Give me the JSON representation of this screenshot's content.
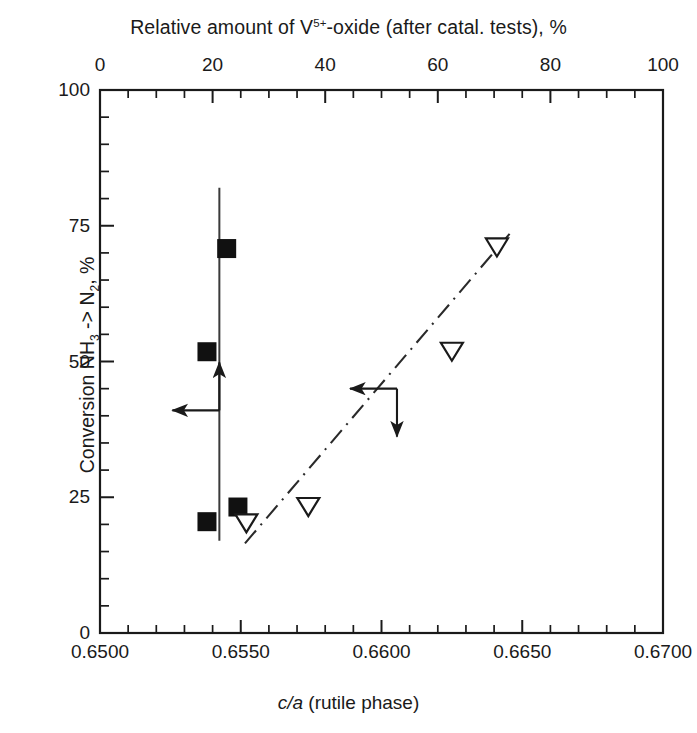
{
  "figure": {
    "top_axis_title": "Relative amount of V5+-oxide (after catal. tests), %",
    "top_axis_title_pre": "Relative amount of V",
    "top_axis_title_sup": "5+",
    "top_axis_title_post": "-oxide (after catal. tests), %",
    "bottom_axis_title_italic": "c/a",
    "bottom_axis_title_rest": " (rutile phase)",
    "y_axis_title_pre": "Conversion NH",
    "y_axis_title_sub1": "3",
    "y_axis_title_mid": " -> N",
    "y_axis_title_sub2": "2",
    "y_axis_title_post": ", %",
    "line_color": "#1a1a1a",
    "marker_color": "#111111"
  },
  "chart_data": {
    "type": "scatter",
    "title": "",
    "xlabel": "c/a (rutile phase)",
    "ylabel": "Conversion NH3 -> N2, %",
    "top_xlabel": "Relative amount of V5+-oxide (after catal. tests), %",
    "xlim": [
      0.65,
      0.67
    ],
    "ylim": [
      0,
      100
    ],
    "top_xlim": [
      0,
      100
    ],
    "grid": false,
    "legend": "none",
    "x_ticks_bottom": [
      "0.6500",
      "0.6550",
      "0.6600",
      "0.6650",
      "0.6700"
    ],
    "x_tick_values_bottom": [
      0.65,
      0.655,
      0.66,
      0.665,
      0.67
    ],
    "x_minor_per_interval_bottom": 4,
    "x_ticks_top": [
      "0",
      "20",
      "40",
      "60",
      "80",
      "100"
    ],
    "x_tick_values_top": [
      0,
      20,
      40,
      60,
      80,
      100
    ],
    "x_minor_per_interval_top": 3,
    "y_ticks": [
      "0",
      "25",
      "50",
      "75",
      "100"
    ],
    "y_tick_values": [
      0,
      25,
      50,
      75,
      100
    ],
    "y_minor_per_interval": 4,
    "series": [
      {
        "name": "filled-squares",
        "marker": "filled-square",
        "axis": "top",
        "points": [
          {
            "x": 22.5,
            "y": 70.8
          },
          {
            "x": 19.0,
            "y": 51.8
          },
          {
            "x": 24.5,
            "y": 23.2
          },
          {
            "x": 19.0,
            "y": 20.5
          }
        ]
      },
      {
        "name": "open-triangles",
        "marker": "open-triangle-down",
        "axis": "bottom",
        "points": [
          {
            "x": 0.6641,
            "y": 71.0
          },
          {
            "x": 0.6625,
            "y": 51.8
          },
          {
            "x": 0.6574,
            "y": 23.2
          },
          {
            "x": 0.6552,
            "y": 20.2
          }
        ]
      }
    ],
    "annotations": [
      {
        "name": "vertical-solid-line",
        "kind": "solid-vline",
        "x_top_axis": 21.2,
        "y_from": 17.0,
        "y_to": 82.0
      },
      {
        "name": "dash-dot-trend-line",
        "kind": "dash-dot-line",
        "x_from": 0.65515,
        "y_from": 16.5,
        "x_to": 0.66455,
        "y_to": 73.5
      },
      {
        "name": "left-corner-arrows",
        "kind": "corner-arrows",
        "directions": [
          "left",
          "up"
        ],
        "anchor_x_top_axis": 21.2,
        "anchor_y": 41.0
      },
      {
        "name": "right-corner-arrows",
        "kind": "corner-arrows",
        "directions": [
          "left",
          "down"
        ],
        "anchor_x": 0.66055,
        "anchor_y": 45.0
      }
    ]
  }
}
